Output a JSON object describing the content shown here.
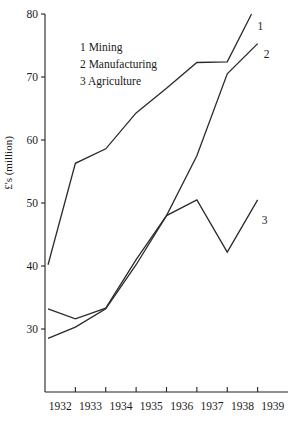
{
  "chart_data": {
    "type": "line",
    "title": "",
    "xlabel": "",
    "ylabel": "£'s (million)",
    "xlim": [
      1931.5,
      1939.5
    ],
    "ylim": [
      20,
      80
    ],
    "grid": false,
    "legend_position": "inside-upper-left",
    "x": [
      "1932",
      "1933",
      "1934",
      "1935",
      "1936",
      "1937",
      "1938",
      "1939"
    ],
    "xtick_labels": [
      "1932",
      "1933",
      "1934",
      "1935",
      "1936",
      "1937",
      "1938",
      "1939"
    ],
    "ytick_labels": [
      "30",
      "40",
      "50",
      "60",
      "70",
      "80"
    ],
    "ytick_values": [
      30,
      40,
      50,
      60,
      70,
      80
    ],
    "series": [
      {
        "key": "1",
        "name": "Mining",
        "legend_label": "1 Mining",
        "end_tag": "1",
        "x": [
          1931.6,
          1932.5,
          1933.5,
          1934.5,
          1935.5,
          1936.5,
          1937.5,
          1938.3
        ],
        "values": [
          40.2,
          56.3,
          58.6,
          64.3,
          68.2,
          72.3,
          72.4,
          80.0
        ]
      },
      {
        "key": "2",
        "name": "Manufacturing",
        "legend_label": "2 Manufacturing",
        "end_tag": "2",
        "x": [
          1931.6,
          1932.5,
          1933.5,
          1934.5,
          1935.5,
          1936.5,
          1937.5,
          1938.5
        ],
        "values": [
          33.2,
          31.6,
          33.3,
          41.0,
          48.0,
          57.5,
          70.5,
          75.3
        ]
      },
      {
        "key": "3",
        "name": "Agriculture",
        "legend_label": "3 Agriculture",
        "end_tag": "3",
        "x": [
          1931.6,
          1932.5,
          1933.5,
          1934.5,
          1935.5,
          1936.5,
          1937.5,
          1938.5
        ],
        "values": [
          28.5,
          30.3,
          33.2,
          40.2,
          48.0,
          50.5,
          42.2,
          50.5
        ]
      }
    ],
    "legend_entries": [
      "1 Mining",
      "2 Manufacturing",
      "3 Agriculture"
    ]
  }
}
